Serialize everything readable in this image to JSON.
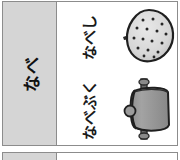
{
  "document": {
    "type": "scanned-table-fragment",
    "colors": {
      "header_fill": "#d5d5d5",
      "rule": "#8c8c8c",
      "ink": "#1a1a1a",
      "page": "#ffffff",
      "metal_light": "#d8d8d8",
      "metal_mid": "#9a9a9a",
      "metal_dark": "#6e6e6e"
    }
  },
  "table": {
    "header_column": {
      "label": "なべ",
      "orientation": "vertical-rotated"
    },
    "rows": [
      {
        "label": "なべし",
        "illustration_name": "frying-pan-top-view",
        "illustration_caption": "pan seen from above with perforated base and side handle"
      },
      {
        "label": "なべぶく",
        "illustration_name": "pot-side-view",
        "illustration_caption": "covered pot seen from the side with lid handle and side knob"
      }
    ]
  },
  "table_next": {
    "header_column": {
      "label": ""
    }
  }
}
